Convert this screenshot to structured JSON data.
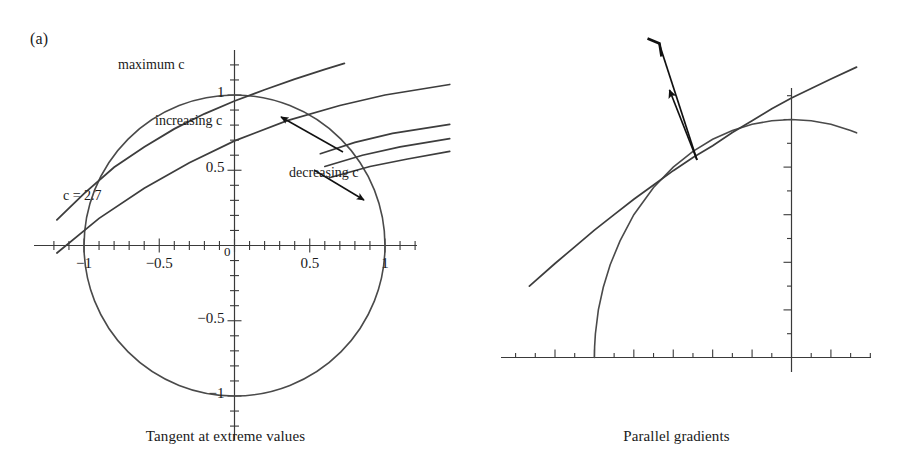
{
  "figure": {
    "panels": [
      {
        "id": "a",
        "label": "(a)",
        "caption": "Tangent at extreme values",
        "annotations": {
          "maximum_c": "maximum c",
          "increasing_c": "increasing c",
          "decreasing_c": "decreasing c",
          "c_value": "c = 2.7"
        },
        "x_tick_labels": [
          "−1",
          "−0.5",
          "0",
          "0.5",
          "1"
        ],
        "y_tick_labels": [
          "1",
          "0.5",
          "−0.5",
          "−1"
        ]
      },
      {
        "id": "b",
        "label": "(b)",
        "caption": "Parallel gradients",
        "annotations": {
          "grad_f": "∇f",
          "grad_g": "∇g"
        },
        "x_tick_labels": [
          "−1.2",
          "−1.0",
          "−0.8",
          "−0.6",
          "−0.4",
          "−0.2",
          "0",
          "0.2"
        ],
        "y_tick_labels": [
          "1",
          "0.8",
          "0.6",
          "0.4",
          "0.2"
        ]
      }
    ]
  },
  "chart_data": [
    {
      "type": "line",
      "panel": "a",
      "title": "Tangent at extreme values",
      "xlabel": "",
      "ylabel": "",
      "xlim": [
        -1.18,
        1.43
      ],
      "ylim": [
        -1.22,
        1.28
      ],
      "grid": false,
      "legend": "none",
      "xticks": [
        -1,
        -0.5,
        0,
        0.5,
        1
      ],
      "xtick_labels": [
        "−1",
        "−0.5",
        "0",
        "0.5",
        "1"
      ],
      "yticks": [
        -1,
        -0.5,
        0.5,
        1
      ],
      "ytick_labels": [
        "−1",
        "−0.5",
        "0.5",
        "1"
      ],
      "minor_tick_step": 0.1,
      "series": [
        {
          "name": "constraint circle",
          "kind": "circle",
          "center": [
            0,
            0
          ],
          "radius": 1.0
        },
        {
          "name": "level curve c = 2.7 (tangent)",
          "kind": "level-curve",
          "c": 2.7,
          "points": [
            [
              -1.18,
              0.17
            ],
            [
              -1.0,
              0.345
            ],
            [
              -0.8,
              0.52
            ],
            [
              -0.6,
              0.655
            ],
            [
              -0.4,
              0.775
            ],
            [
              -0.2,
              0.875
            ],
            [
              0.0,
              0.96
            ],
            [
              0.2,
              1.035
            ],
            [
              0.4,
              1.105
            ],
            [
              0.6,
              1.17
            ],
            [
              0.73,
              1.21
            ]
          ]
        },
        {
          "name": "level curve family member 2",
          "kind": "level-curve",
          "points": [
            [
              -1.18,
              -0.05
            ],
            [
              -0.9,
              0.18
            ],
            [
              -0.6,
              0.38
            ],
            [
              -0.3,
              0.55
            ],
            [
              0.0,
              0.695
            ],
            [
              0.35,
              0.83
            ],
            [
              0.7,
              0.93
            ],
            [
              1.0,
              1.0
            ],
            [
              1.43,
              1.07
            ]
          ]
        },
        {
          "name": "level curve family member 3",
          "kind": "level-curve",
          "points": [
            [
              0.57,
              0.61
            ],
            [
              0.8,
              0.685
            ],
            [
              1.05,
              0.745
            ],
            [
              1.43,
              0.805
            ]
          ]
        },
        {
          "name": "level curve family member 4",
          "kind": "level-curve",
          "points": [
            [
              0.6,
              0.525
            ],
            [
              0.85,
              0.6
            ],
            [
              1.1,
              0.655
            ],
            [
              1.43,
              0.71
            ]
          ]
        },
        {
          "name": "level curve family member 5",
          "kind": "level-curve",
          "points": [
            [
              0.63,
              0.45
            ],
            [
              0.9,
              0.525
            ],
            [
              1.15,
              0.575
            ],
            [
              1.43,
              0.625
            ]
          ]
        }
      ],
      "annotations": [
        {
          "text": "maximum c",
          "x": -0.48,
          "y": 1.19,
          "kind": "label"
        },
        {
          "text": "increasing c",
          "x": -0.32,
          "y": 0.78,
          "kind": "label"
        },
        {
          "text": "decreasing c",
          "x": 0.38,
          "y": 0.45,
          "kind": "label"
        },
        {
          "text": "c = 2.7",
          "x": -0.98,
          "y": 0.23,
          "kind": "label"
        },
        {
          "kind": "arrow",
          "name": "increasing-c-arrow",
          "from": [
            0.72,
            0.62
          ],
          "to": [
            0.31,
            0.85
          ]
        },
        {
          "kind": "arrow",
          "name": "decreasing-c-arrow",
          "from": [
            0.53,
            0.5
          ],
          "to": [
            0.86,
            0.3
          ]
        }
      ]
    },
    {
      "type": "line",
      "panel": "b",
      "title": "Parallel gradients",
      "xlabel": "",
      "ylabel": "",
      "xlim": [
        -1.33,
        0.33
      ],
      "ylim": [
        -0.12,
        1.42
      ],
      "grid": false,
      "legend": "none",
      "xticks": [
        -1.2,
        -1.0,
        -0.8,
        -0.6,
        -0.4,
        -0.2,
        0,
        0.2
      ],
      "xtick_labels": [
        "−1.2",
        "−1.0",
        "−0.8",
        "−0.6",
        "−0.4",
        "−0.2",
        "0",
        "0.2"
      ],
      "yticks": [
        0.2,
        0.4,
        0.6,
        0.8,
        1.0
      ],
      "ytick_labels": [
        "0.2",
        "0.4",
        "0.6",
        "0.8",
        "1"
      ],
      "minor_tick_step_x": 0.1,
      "minor_tick_step_y": 0.1,
      "series": [
        {
          "name": "constraint circle (upper-left arc)",
          "kind": "circle-arc",
          "center": [
            0,
            0
          ],
          "radius": 1.0,
          "points": [
            [
              -1.0,
              0.0
            ],
            [
              -0.999,
              0.045
            ],
            [
              -0.995,
              0.1
            ],
            [
              -0.98,
              0.2
            ],
            [
              -0.955,
              0.295
            ],
            [
              -0.92,
              0.39
            ],
            [
              -0.87,
              0.49
            ],
            [
              -0.8,
              0.6
            ],
            [
              -0.7,
              0.714
            ],
            [
              -0.6,
              0.8
            ],
            [
              -0.5,
              0.866
            ],
            [
              -0.4,
              0.917
            ],
            [
              -0.3,
              0.954
            ],
            [
              -0.2,
              0.98
            ],
            [
              -0.1,
              0.995
            ],
            [
              0.0,
              1.0
            ],
            [
              0.1,
              0.995
            ],
            [
              0.2,
              0.98
            ],
            [
              0.3,
              0.954
            ],
            [
              0.33,
              0.944
            ]
          ]
        },
        {
          "name": "tangent level curve",
          "kind": "level-curve",
          "points": [
            [
              -1.33,
              0.3
            ],
            [
              -1.2,
              0.395
            ],
            [
              -1.1,
              0.465
            ],
            [
              -1.0,
              0.535
            ],
            [
              -0.9,
              0.6
            ],
            [
              -0.8,
              0.665
            ],
            [
              -0.7,
              0.725
            ],
            [
              -0.6,
              0.785
            ],
            [
              -0.5,
              0.84
            ],
            [
              -0.4,
              0.89
            ],
            [
              -0.3,
              0.945
            ],
            [
              -0.2,
              0.995
            ],
            [
              -0.1,
              1.045
            ],
            [
              0.0,
              1.09
            ],
            [
              0.1,
              1.13
            ],
            [
              0.2,
              1.17
            ],
            [
              0.33,
              1.22
            ]
          ]
        }
      ],
      "annotations": [
        {
          "text": "∇f",
          "x": -0.44,
          "y": 1.345,
          "kind": "label"
        },
        {
          "text": "∇g",
          "x": -0.78,
          "y": 0.99,
          "kind": "label"
        },
        {
          "kind": "arrow",
          "name": "grad-f-arrow",
          "from": [
            -0.555,
            0.865
          ],
          "to": [
            -0.725,
            1.395
          ],
          "head": "open"
        },
        {
          "kind": "arrow",
          "name": "grad-g-arrow",
          "from": [
            -0.555,
            0.865
          ],
          "to": [
            -0.655,
            1.185
          ],
          "head": "filled"
        }
      ]
    }
  ]
}
